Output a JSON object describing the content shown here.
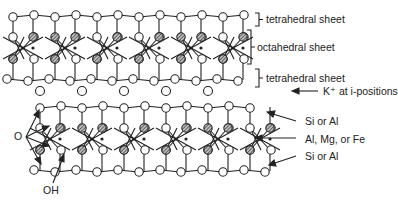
{
  "labels": {
    "tetrahedral_top": "tetrahedral sheet",
    "octahedral": "octahedral sheet",
    "tetrahedral_bottom": "tetrahedral sheet",
    "k_ion": "K⁺ at i-positions",
    "si_al_top": "Si or Al",
    "octa_cation": "Al, Mg, or Fe",
    "si_al_bottom": "Si or Al",
    "oxygen": "O",
    "hydroxyl": "OH"
  },
  "colors": {
    "line": "#222222",
    "hatch": "#666666",
    "background": "#ffffff"
  },
  "legend": [
    {
      "symbol": "open-circle",
      "meaning": "O"
    },
    {
      "symbol": "hatched-circle",
      "meaning": "OH"
    },
    {
      "symbol": "small-dot",
      "meaning": "cation"
    }
  ]
}
